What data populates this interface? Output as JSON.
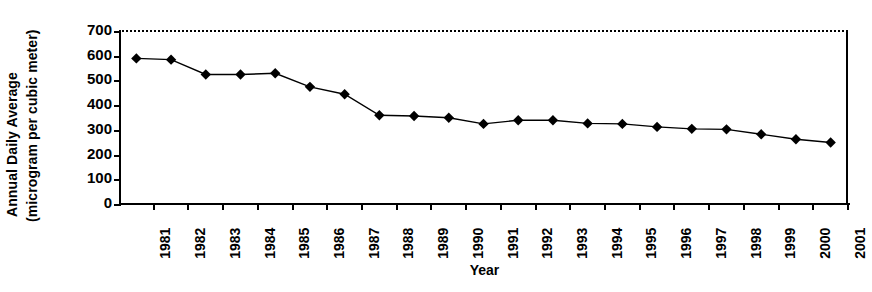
{
  "chart_data": {
    "type": "line",
    "title": "",
    "xlabel": "Year",
    "ylabel": "Annual Daily Average (microgram per cubic meter)",
    "ylabel_line1": "Annual Daily Average",
    "ylabel_line2": "(microgram per cubic meter)",
    "categories": [
      "1981",
      "1982",
      "1983",
      "1984",
      "1985",
      "1986",
      "1987",
      "1988",
      "1989",
      "1990",
      "1991",
      "1992",
      "1993",
      "1994",
      "1995",
      "1996",
      "1997",
      "1998",
      "1999",
      "2000",
      "2001"
    ],
    "values": [
      585,
      580,
      520,
      520,
      525,
      470,
      440,
      355,
      352,
      345,
      320,
      335,
      335,
      322,
      320,
      308,
      300,
      298,
      278,
      258,
      245
    ],
    "series": [
      {
        "name": "Annual Daily Average",
        "values": [
          585,
          580,
          520,
          520,
          525,
          470,
          440,
          355,
          352,
          345,
          320,
          335,
          335,
          322,
          320,
          308,
          300,
          298,
          278,
          258,
          245
        ]
      }
    ],
    "ylim": [
      0,
      700
    ],
    "yticks": [
      0,
      100,
      200,
      300,
      400,
      500,
      600,
      700
    ],
    "ytick_labels": [
      "0",
      "100",
      "200",
      "300",
      "400",
      "500",
      "600",
      "700"
    ],
    "grid": false,
    "legend": null,
    "legend_position": "none",
    "marker": "diamond",
    "marker_color": "#000000",
    "line_color": "#000000",
    "top_border_style": "dotted",
    "background_color": "#ffffff"
  }
}
